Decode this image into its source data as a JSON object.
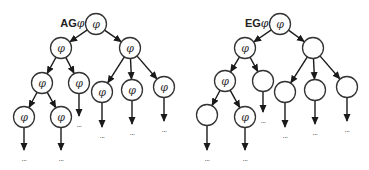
{
  "diagram": {
    "symbol": "φ",
    "ellipsis": "...",
    "trees": [
      {
        "id": "ag",
        "label_op": "AG",
        "label_symbol": "φ",
        "nodes": [
          {
            "id": "root",
            "x": 96,
            "y": 24,
            "label": "φ"
          },
          {
            "id": "l",
            "x": 61,
            "y": 48,
            "label": "φ"
          },
          {
            "id": "r",
            "x": 130,
            "y": 48,
            "label": "φ"
          },
          {
            "id": "ll",
            "x": 42,
            "y": 83,
            "label": "φ"
          },
          {
            "id": "lr",
            "x": 79,
            "y": 83,
            "label": "φ"
          },
          {
            "id": "r1",
            "x": 102,
            "y": 92,
            "label": "φ"
          },
          {
            "id": "r2",
            "x": 132,
            "y": 90,
            "label": "φ"
          },
          {
            "id": "r3",
            "x": 164,
            "y": 87,
            "label": "φ"
          },
          {
            "id": "lll",
            "x": 24,
            "y": 117,
            "label": "φ"
          },
          {
            "id": "llr",
            "x": 61,
            "y": 117,
            "label": "φ"
          }
        ],
        "edges": [
          [
            "root",
            "l"
          ],
          [
            "root",
            "r"
          ],
          [
            "l",
            "ll"
          ],
          [
            "l",
            "lr"
          ],
          [
            "r",
            "r1"
          ],
          [
            "r",
            "r2"
          ],
          [
            "r",
            "r3"
          ],
          [
            "ll",
            "lll"
          ],
          [
            "ll",
            "llr"
          ]
        ],
        "tails": [
          {
            "from": "lr",
            "dots_y": 124
          },
          {
            "from": "r1",
            "dots_y": 135
          },
          {
            "from": "r2",
            "dots_y": 132
          },
          {
            "from": "r3",
            "dots_y": 129
          },
          {
            "from": "lll",
            "dots_y": 158
          },
          {
            "from": "llr",
            "dots_y": 158
          }
        ]
      },
      {
        "id": "eg",
        "label_op": "EG",
        "label_symbol": "φ",
        "nodes": [
          {
            "id": "root",
            "x": 280,
            "y": 24,
            "label": "φ"
          },
          {
            "id": "l",
            "x": 245,
            "y": 48,
            "label": "φ"
          },
          {
            "id": "r",
            "x": 313,
            "y": 48,
            "label": ""
          },
          {
            "id": "ll",
            "x": 225,
            "y": 81,
            "label": "φ"
          },
          {
            "id": "lr",
            "x": 263,
            "y": 81,
            "label": ""
          },
          {
            "id": "r1",
            "x": 285,
            "y": 92,
            "label": ""
          },
          {
            "id": "r2",
            "x": 315,
            "y": 90,
            "label": ""
          },
          {
            "id": "r3",
            "x": 347,
            "y": 87,
            "label": ""
          },
          {
            "id": "lll",
            "x": 207,
            "y": 115,
            "label": ""
          },
          {
            "id": "llr",
            "x": 245,
            "y": 117,
            "label": "φ"
          }
        ],
        "edges": [
          [
            "root",
            "l"
          ],
          [
            "root",
            "r"
          ],
          [
            "l",
            "ll"
          ],
          [
            "l",
            "lr"
          ],
          [
            "r",
            "r1"
          ],
          [
            "r",
            "r2"
          ],
          [
            "r",
            "r3"
          ],
          [
            "ll",
            "lll"
          ],
          [
            "ll",
            "llr"
          ]
        ],
        "tails": [
          {
            "from": "lr",
            "dots_y": 120
          },
          {
            "from": "r1",
            "dots_y": 135
          },
          {
            "from": "r2",
            "dots_y": 132
          },
          {
            "from": "r3",
            "dots_y": 129
          },
          {
            "from": "lll",
            "dots_y": 158
          },
          {
            "from": "llr",
            "dots_y": 158
          }
        ]
      }
    ],
    "style": {
      "node_radius": 10.5,
      "stroke": "#333333",
      "background": "#ffffff"
    }
  }
}
